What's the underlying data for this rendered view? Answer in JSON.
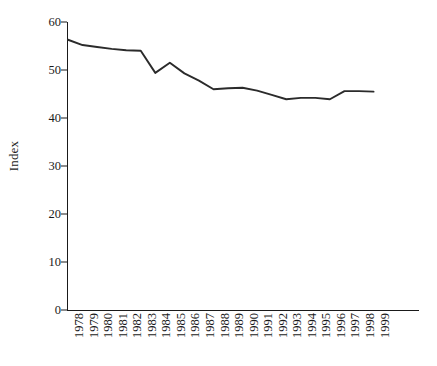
{
  "chart_data": {
    "type": "line",
    "title": "",
    "xlabel": "",
    "ylabel": "Index",
    "ylim": [
      0,
      60
    ],
    "yticks": [
      0,
      10,
      20,
      30,
      40,
      50,
      60
    ],
    "grid": false,
    "legend": null,
    "line_color": "#2b2b2b",
    "categories": [
      "1978",
      "1979",
      "1980",
      "1981",
      "1982",
      "1983",
      "1984",
      "1985",
      "1986",
      "1987",
      "1988",
      "1989",
      "1990",
      "1991",
      "1992",
      "1993",
      "1994",
      "1995",
      "1996",
      "1997",
      "1998",
      "1999"
    ],
    "values": [
      56.3,
      55.2,
      54.8,
      54.4,
      54.1,
      54.0,
      49.4,
      51.5,
      49.3,
      47.8,
      46.0,
      46.2,
      46.3,
      45.7,
      44.8,
      43.9,
      44.2,
      44.2,
      43.9,
      45.6,
      45.6,
      45.5
    ]
  },
  "axes": {
    "y_title": "Index"
  }
}
